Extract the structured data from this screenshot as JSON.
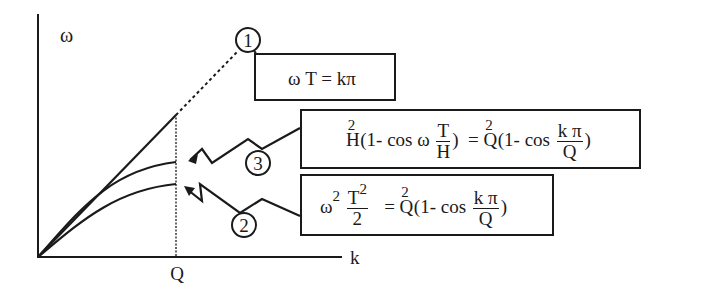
{
  "diagram": {
    "type": "dispersion-relation-plot",
    "axes": {
      "y_label": "ω",
      "x_label": "k",
      "x_marker_label": "Q"
    },
    "curves": [
      {
        "id": "1",
        "description": "linear dispersion, continues dotted beyond Q"
      },
      {
        "id": "3",
        "description": "middle curve, saturates at Q"
      },
      {
        "id": "2",
        "description": "lowest curve, saturates at Q"
      }
    ],
    "callouts": [
      {
        "id": "1",
        "label": "1",
        "equation_text": "ω T = kπ"
      },
      {
        "id": "3",
        "label": "3",
        "equation_text": "H²(1- cos ω T/H) = Q²(1- cos kπ/Q)"
      },
      {
        "id": "2",
        "label": "2",
        "equation_text": "ω²T²/2 = Q²(1- cos kπ/Q)"
      }
    ],
    "eq1": {
      "omega": "ω",
      "T": "T",
      "eq": "=",
      "rhs": "kπ"
    },
    "eq3": {
      "H": "H",
      "H_exp": "2",
      "lhs_open": "(1- cos ω",
      "frac_num": "T",
      "frac_den": "H",
      "lhs_close": ")",
      "eq": "=",
      "Q": "Q",
      "Q_exp": "2",
      "rhs_open": "(1- cos",
      "rhs_num": "k π",
      "rhs_den": "Q",
      "rhs_close": ")"
    },
    "eq2": {
      "omega": "ω",
      "omega_exp": "2",
      "frac_num": "T",
      "frac_num_exp": "2",
      "frac_den": "2",
      "eq": "=",
      "Q": "Q",
      "Q_exp": "2",
      "rhs_open": "(1- cos",
      "rhs_num": "k π",
      "rhs_den": "Q",
      "rhs_close": ")"
    }
  }
}
